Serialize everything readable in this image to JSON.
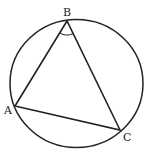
{
  "diagram": {
    "type": "inscribed-triangle",
    "circle": {
      "cx": 76.5,
      "cy": 83.5,
      "rx": 66.5,
      "ry": 64
    },
    "points": {
      "A": {
        "x": 15,
        "y": 106,
        "label": "A",
        "lx": 4,
        "ly": 114
      },
      "B": {
        "x": 67,
        "y": 21,
        "label": "B",
        "lx": 63,
        "ly": 16
      },
      "C": {
        "x": 120,
        "y": 130,
        "label": "C",
        "lx": 123,
        "ly": 141
      }
    },
    "angle_mark": {
      "vertex": "B",
      "label": ""
    },
    "stroke_color": "#222222",
    "background": "#ffffff"
  }
}
